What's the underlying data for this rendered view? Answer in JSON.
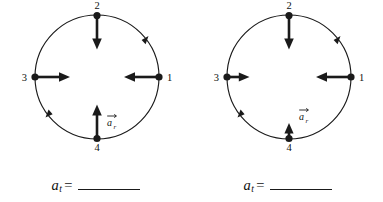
{
  "figure": {
    "background_color": "#ffffff",
    "ink_color": "#111111",
    "panel_count": 2
  },
  "panels": [
    {
      "id": "panel-left",
      "circle": {
        "cx": 97,
        "cy": 77,
        "r": 62
      },
      "rotation_marks": [
        "upper-right",
        "lower-left"
      ],
      "points": [
        {
          "id": "p1",
          "label": "1",
          "position": "right",
          "label_x": 168,
          "label_y": 81
        },
        {
          "id": "p2",
          "label": "2",
          "position": "top",
          "label_x": 97,
          "label_y": 11
        },
        {
          "id": "p3",
          "label": "3",
          "position": "left",
          "label_x": 27,
          "label_y": 81
        },
        {
          "id": "p4",
          "label": "4",
          "position": "bottom",
          "label_x": 97,
          "label_y": 152
        }
      ],
      "vectors": [
        {
          "id": "v1",
          "at_point": "1",
          "direction": "left",
          "length": 36
        },
        {
          "id": "v2",
          "at_point": "2",
          "direction": "down",
          "length": 33
        },
        {
          "id": "v3",
          "at_point": "3",
          "direction": "right",
          "length": 36
        },
        {
          "id": "v4",
          "at_point": "4",
          "direction": "up",
          "length": 33
        }
      ],
      "vector_label": {
        "symbol": "a",
        "subscript": "r",
        "has_arrow_accent": true,
        "x": 112,
        "y": 124
      },
      "formula": {
        "symbol": "a",
        "subscript": "t",
        "equals": "=",
        "answer": ""
      }
    },
    {
      "id": "panel-right",
      "circle": {
        "cx": 97,
        "cy": 77,
        "r": 62
      },
      "rotation_marks": [
        "upper-right",
        "lower-left"
      ],
      "points": [
        {
          "id": "p1",
          "label": "1",
          "position": "right",
          "label_x": 168,
          "label_y": 81
        },
        {
          "id": "p2",
          "label": "2",
          "position": "top",
          "label_x": 97,
          "label_y": 11
        },
        {
          "id": "p3",
          "label": "3",
          "position": "left",
          "label_x": 27,
          "label_y": 81
        },
        {
          "id": "p4",
          "label": "4",
          "position": "bottom",
          "label_x": 97,
          "label_y": 152
        }
      ],
      "vectors": [
        {
          "id": "v1",
          "at_point": "1",
          "direction": "left",
          "length": 36
        },
        {
          "id": "v2",
          "at_point": "2",
          "direction": "down",
          "length": 33
        },
        {
          "id": "v3",
          "at_point": "3",
          "direction": "right",
          "length": 23
        },
        {
          "id": "v4",
          "at_point": "4",
          "direction": "up",
          "length": 15
        }
      ],
      "vector_label": {
        "symbol": "a",
        "subscript": "r",
        "has_arrow_accent": true,
        "x": 112,
        "y": 118
      },
      "formula": {
        "symbol": "a",
        "subscript": "t",
        "equals": "=",
        "answer": ""
      }
    }
  ]
}
